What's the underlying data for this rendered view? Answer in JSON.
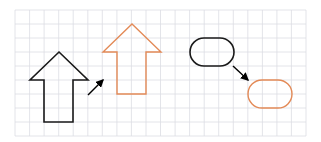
{
  "diagram": {
    "title": "",
    "colors": {
      "background": "#ffffff",
      "grid": "#dcdde3",
      "source": "#1a1a1a",
      "target": "#e38a57",
      "connector": "#000000"
    },
    "grid": {
      "x": 15,
      "y": 10,
      "width": 291,
      "height": 126,
      "cols": 20,
      "rows": 9
    },
    "groups": [
      {
        "name": "arrow-shape-transform",
        "source": {
          "shape": "up-arrow",
          "color": "source",
          "points": "59,52 88,80 73,80 73,122 44,122 44,80 30,80"
        },
        "connector": {
          "from": [
            88,
            95
          ],
          "to": [
            103,
            80
          ]
        },
        "target": {
          "shape": "up-arrow",
          "color": "target",
          "points": "132,24 161,52 146,52 146,94 117,94 117,52 103,52"
        }
      },
      {
        "name": "pill-shape-transform",
        "source": {
          "shape": "rounded-rectangle",
          "color": "source",
          "x": 190,
          "y": 38,
          "width": 44,
          "height": 28,
          "rx": 14
        },
        "connector": {
          "from": [
            233,
            66
          ],
          "to": [
            248,
            80
          ]
        },
        "target": {
          "shape": "rounded-rectangle",
          "color": "target",
          "x": 248,
          "y": 80,
          "width": 44,
          "height": 28,
          "rx": 14
        }
      }
    ]
  }
}
